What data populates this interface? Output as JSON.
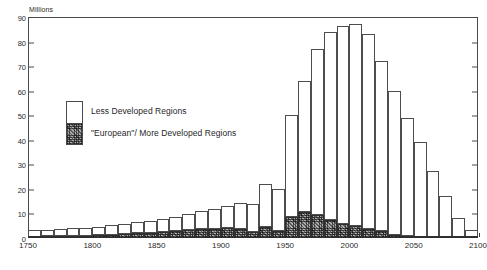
{
  "chart_data": {
    "type": "bar",
    "title": "Increase in numbers, by decade",
    "xlabel": "",
    "ylabel": "Millions",
    "ylim": [
      0,
      90
    ],
    "xlim": [
      1750,
      2100
    ],
    "ytick_labels": [
      "0",
      "10",
      "20",
      "30",
      "40",
      "50",
      "60",
      "70",
      "80",
      "90"
    ],
    "ytick_values": [
      0,
      10,
      20,
      30,
      40,
      50,
      60,
      70,
      80,
      90
    ],
    "xtick_labels": [
      "1750",
      "1800",
      "1850",
      "1900",
      "1950",
      "2000",
      "2050",
      "2100"
    ],
    "xtick_values": [
      1750,
      1800,
      1850,
      1900,
      1950,
      2000,
      2050,
      2100
    ],
    "grid": false,
    "stacked": true,
    "legend_position": "upper-left-inset",
    "categories": [
      "1750",
      "1760",
      "1770",
      "1780",
      "1790",
      "1800",
      "1810",
      "1820",
      "1830",
      "1840",
      "1850",
      "1860",
      "1870",
      "1880",
      "1890",
      "1900",
      "1910",
      "1920",
      "1930",
      "1940",
      "1950",
      "1960",
      "1970",
      "1980",
      "1990",
      "2000",
      "2010",
      "2020",
      "2030",
      "2040",
      "2050",
      "2060",
      "2070",
      "2080",
      "2090"
    ],
    "series": [
      {
        "name": "\"European\"/ More Developed Regions",
        "color": "#8e8e8e",
        "pattern": "stipple",
        "values": [
          0.6,
          0.7,
          0.8,
          0.9,
          1.0,
          1.2,
          1.4,
          1.6,
          1.9,
          2.2,
          2.5,
          2.8,
          3.2,
          3.5,
          3.8,
          4.2,
          3.5,
          2.6,
          4.4,
          3.0,
          8.4,
          10.6,
          9.4,
          7.4,
          5.6,
          4.8,
          3.6,
          3.0,
          1.4,
          0.8,
          0.5,
          0.3,
          0.2,
          0.1,
          0.1
        ]
      },
      {
        "name": "Less Developed Regions",
        "color": "#ffffff",
        "pattern": "solid",
        "values": [
          2.5,
          2.6,
          2.7,
          3.0,
          3.2,
          3.4,
          3.7,
          4.1,
          4.5,
          4.9,
          5.4,
          5.9,
          6.6,
          7.3,
          8.1,
          9.0,
          10.6,
          11.3,
          17.6,
          17.0,
          41.6,
          53.4,
          67.6,
          76.4,
          80.9,
          82.2,
          79.4,
          69.0,
          58.6,
          48.2,
          38.5,
          27.0,
          17.0,
          8.0,
          3.0
        ]
      }
    ],
    "totals": [
      3.1,
      3.3,
      3.5,
      3.9,
      4.2,
      4.6,
      5.1,
      5.7,
      6.4,
      7.1,
      7.9,
      8.7,
      9.8,
      10.8,
      11.9,
      13.2,
      14.1,
      13.9,
      22.0,
      20.0,
      50.0,
      64.0,
      77.0,
      83.8,
      86.5,
      87.0,
      83.0,
      72.0,
      60.0,
      49.0,
      39.0,
      27.3,
      17.2,
      8.1,
      3.1
    ]
  },
  "legend": {
    "entries": [
      {
        "label": "Less Developed Regions"
      },
      {
        "label": "\"European\"/ More Developed Regions"
      }
    ]
  },
  "axes": {
    "unit_label": "Millions"
  }
}
